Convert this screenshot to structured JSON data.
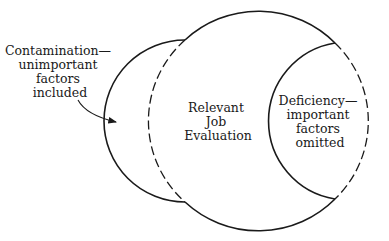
{
  "diagram": {
    "type": "venn-overlap",
    "colors": {
      "stroke": "#1a1a1a",
      "background": "#ffffff"
    },
    "center_label": {
      "lines": [
        "Relevant",
        "Job",
        "Evaluation"
      ]
    },
    "left_label": {
      "lines": [
        "Contamination—",
        "unimportant",
        "factors",
        "included"
      ]
    },
    "right_label": {
      "lines": [
        "Deficiency—",
        "important",
        "factors",
        "omitted"
      ]
    }
  }
}
